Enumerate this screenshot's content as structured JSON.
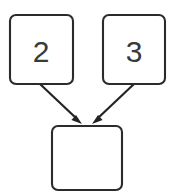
{
  "diagram": {
    "type": "node-graph",
    "canvas": {
      "width": 195,
      "height": 195,
      "background": "#ffffff"
    },
    "style": {
      "node_fill": "#ffffff",
      "node_stroke": "#2b2b2b",
      "node_stroke_width": 2.1,
      "node_corner_radius": 6,
      "label_color": "#3a3a3a",
      "label_font_size": 30,
      "edge_color": "#232323",
      "edge_stroke_width": 2.2
    },
    "nodes": [
      {
        "id": "node-left",
        "name": "operand-left",
        "label": "2",
        "x": 10,
        "y": 15,
        "width": 63,
        "height": 69,
        "label_x": 41,
        "label_y": 50
      },
      {
        "id": "node-right",
        "name": "operand-right",
        "label": "3",
        "x": 103,
        "y": 15,
        "width": 62,
        "height": 69,
        "label_x": 134,
        "label_y": 50
      },
      {
        "id": "node-result",
        "name": "result",
        "label": "",
        "x": 52,
        "y": 126,
        "width": 70,
        "height": 64,
        "label_x": 87,
        "label_y": 158
      }
    ],
    "edges": [
      {
        "id": "edge-left-to-result",
        "from": "node-left",
        "to": "node-result",
        "x1": 40,
        "y1": 84,
        "x2": 81,
        "y2": 123,
        "arrowhead": "filled-triangle"
      },
      {
        "id": "edge-right-to-result",
        "from": "node-right",
        "to": "node-result",
        "x1": 134,
        "y1": 84,
        "x2": 93,
        "y2": 123,
        "arrowhead": "filled-triangle"
      }
    ]
  }
}
